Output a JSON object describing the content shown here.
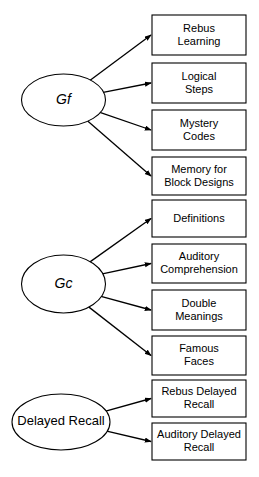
{
  "diagram": {
    "type": "path-diagram",
    "stroke_color": "#000000",
    "fill_color": "#ffffff",
    "background_color": "#ffffff",
    "groups": [
      {
        "id": "gf",
        "factor": {
          "label": "Gf",
          "shape": "ellipse",
          "italic": true,
          "cx": 63.5,
          "cy": 100,
          "rx": 42,
          "ry": 26
        },
        "indicators": [
          {
            "id": "rebus-learning",
            "lines": [
              "Rebus",
              "Learning"
            ],
            "x": 152,
            "y": 15,
            "w": 94,
            "h": 40
          },
          {
            "id": "logical-steps",
            "lines": [
              "Logical",
              "Steps"
            ],
            "x": 152,
            "y": 63,
            "w": 94,
            "h": 40
          },
          {
            "id": "mystery-codes",
            "lines": [
              "Mystery",
              "Codes"
            ],
            "x": 152,
            "y": 110,
            "w": 94,
            "h": 40
          },
          {
            "id": "memory-for-block-designs",
            "lines": [
              "Memory for",
              "Block Designs"
            ],
            "x": 152,
            "y": 157,
            "w": 94,
            "h": 38
          }
        ]
      },
      {
        "id": "gc",
        "factor": {
          "label": "Gc",
          "shape": "ellipse",
          "italic": true,
          "cx": 63.5,
          "cy": 284,
          "rx": 42,
          "ry": 29
        },
        "indicators": [
          {
            "id": "definitions",
            "lines": [
              "Definitions"
            ],
            "x": 152,
            "y": 200,
            "w": 94,
            "h": 37
          },
          {
            "id": "auditory-comprehension",
            "lines": [
              "Auditory",
              "Comprehension"
            ],
            "x": 152,
            "y": 244,
            "w": 94,
            "h": 39
          },
          {
            "id": "double-meanings",
            "lines": [
              "Double",
              "Meanings"
            ],
            "x": 152,
            "y": 290,
            "w": 94,
            "h": 40
          },
          {
            "id": "famous-faces",
            "lines": [
              "Famous",
              "Faces"
            ],
            "x": 152,
            "y": 336,
            "w": 94,
            "h": 39
          }
        ]
      },
      {
        "id": "delayed-recall",
        "factor": {
          "label": "Delayed Recall",
          "shape": "ellipse",
          "italic": false,
          "cx": 61,
          "cy": 422,
          "rx": 49,
          "ry": 28
        },
        "indicators": [
          {
            "id": "rebus-delayed-recall",
            "lines": [
              "Rebus Delayed",
              "Recall"
            ],
            "x": 152,
            "y": 380,
            "w": 94,
            "h": 37
          },
          {
            "id": "auditory-delayed-recall",
            "lines": [
              "Auditory Delayed",
              "Recall"
            ],
            "x": 152,
            "y": 423,
            "w": 94,
            "h": 37
          }
        ]
      }
    ]
  }
}
